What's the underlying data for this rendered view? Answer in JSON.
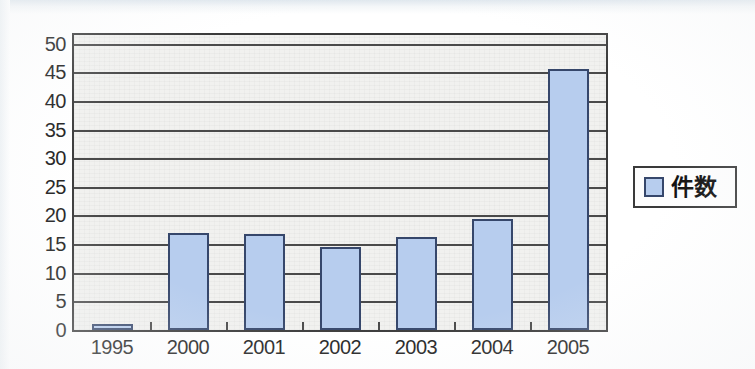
{
  "chart_data": {
    "type": "bar",
    "title": "",
    "xlabel": "",
    "ylabel": "",
    "categories": [
      "1995",
      "2000",
      "2001",
      "2002",
      "2003",
      "2004",
      "2005"
    ],
    "values": [
      1,
      17,
      16.7,
      14.5,
      16.3,
      19.4,
      45.5
    ],
    "series": [
      {
        "name": "件数",
        "values": [
          1,
          17,
          16.7,
          14.5,
          16.3,
          19.4,
          45.5
        ],
        "color": "#b7cdee"
      }
    ],
    "ylim": [
      0,
      51.5
    ],
    "y_ticks": [
      "0",
      "5",
      "10",
      "15",
      "20",
      "25",
      "30",
      "35",
      "40",
      "45",
      "50"
    ],
    "y_tick_values": [
      0,
      5,
      10,
      15,
      20,
      25,
      30,
      35,
      40,
      45,
      50
    ],
    "grid": true,
    "grid_axis": "y",
    "legend": {
      "position": "right",
      "entries": [
        {
          "label": "件数",
          "swatch_color": "#b7cdee"
        }
      ]
    },
    "colors": {
      "bar_fill": "#b7cdee",
      "bar_border": "#36476b",
      "plot_background": "#f1f1ef",
      "axis_line": "#3a3a3a",
      "grid_line": "#4a4a4a",
      "text": "#1c1c1c",
      "page_background": "#ffffff"
    }
  }
}
